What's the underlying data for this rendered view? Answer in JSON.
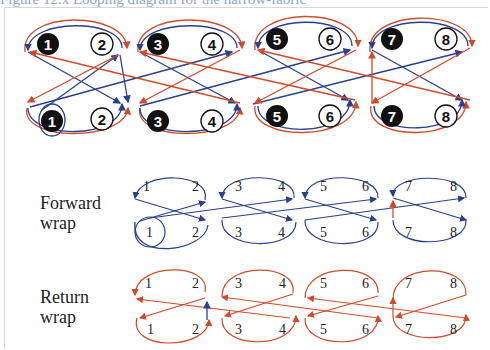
{
  "title": "Figure 12.x Looping diagram for the narrow-fabric",
  "colors": {
    "forward": "#2a3f8f",
    "return": "#d24a2a"
  },
  "top_diagram": {
    "upper_row": [
      "1",
      "2",
      "3",
      "4",
      "5",
      "6",
      "7",
      "8"
    ],
    "lower_row": [
      "1",
      "2",
      "3",
      "4",
      "5",
      "6",
      "7",
      "8"
    ],
    "filled_numbers": [
      "1",
      "3",
      "5",
      "7"
    ],
    "open_numbers": [
      "2",
      "4",
      "6",
      "8"
    ]
  },
  "forward_wrap": {
    "label_line1": "Forward",
    "label_line2": "wrap",
    "upper_row": [
      "1",
      "2",
      "3",
      "4",
      "5",
      "6",
      "7",
      "8"
    ],
    "lower_row": [
      "1",
      "2",
      "3",
      "4",
      "5",
      "6",
      "7",
      "8"
    ]
  },
  "return_wrap": {
    "label_line1": "Return",
    "label_line2": "wrap",
    "upper_row": [
      "1",
      "2",
      "3",
      "4",
      "5",
      "6",
      "7",
      "8"
    ],
    "lower_row": [
      "1",
      "2",
      "3",
      "4",
      "5",
      "6",
      "7",
      "8"
    ]
  }
}
